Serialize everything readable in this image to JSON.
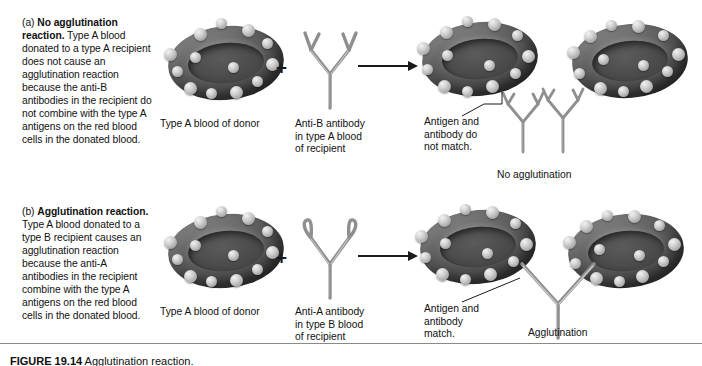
{
  "figure": {
    "panels": [
      {
        "id": "a",
        "marker": "(a)",
        "title": "No agglutination reaction.",
        "body": " Type A blood donated to a type A recipient does not cause an agglutination reaction because the anti-B antibodies in the recipient do not combine with the type A antigens on the red blood cells in the donated blood.",
        "donor_label": "Type A blood of donor",
        "antibody_label": "Anti-B antibody\nin type A blood\nof recipient",
        "callout_label": "Antigen and\nantibody do\nnot match.",
        "result_label": "No agglutination",
        "plus_symbol": "+",
        "antibody_type": "anti-B"
      },
      {
        "id": "b",
        "marker": "(b)",
        "title": "Agglutination reaction.",
        "body": " Type A blood donated to a type B recipient causes an agglutination reaction because the anti-A antibodies in the recipient combine with the type A antigens on the red blood cells in the donated blood.",
        "donor_label": "Type A blood of donor",
        "antibody_label": "Anti-A antibody\nin type B blood\nof recipient",
        "callout_label": "Antigen and\nantibody\nmatch.",
        "result_label": "Agglutination",
        "plus_symbol": "+",
        "antibody_type": "anti-A"
      }
    ],
    "caption": {
      "number": "FIGURE 19.14",
      "text": " Agglutination reaction."
    },
    "colors": {
      "text": "#111111",
      "cell_dark": "#4a4a4a",
      "cell_mid": "#6e6e6e",
      "antigen": "#cfcfcf",
      "antibody": "#8c8c8c",
      "rule": "#8a8a8a",
      "background": "#ffffff"
    }
  }
}
